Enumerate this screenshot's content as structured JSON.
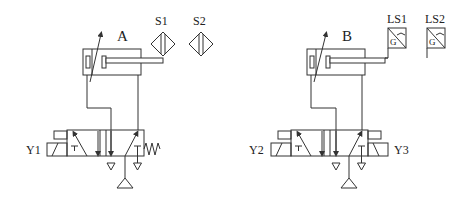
{
  "diagram": {
    "type": "pneumatic-circuit",
    "colors": {
      "stroke": "#333333",
      "background": "#ffffff"
    },
    "systems": [
      {
        "cylinder_label": "A",
        "sensors": [
          {
            "label": "S1",
            "type": "proximity-sensor"
          },
          {
            "label": "S2",
            "type": "proximity-sensor"
          }
        ],
        "valve": {
          "type": "4/2 solenoid valve, spring return",
          "solenoids": [
            "Y1"
          ]
        }
      },
      {
        "cylinder_label": "B",
        "sensors": [
          {
            "label": "LS1",
            "type": "limit-switch",
            "inner_label": "G"
          },
          {
            "label": "LS2",
            "type": "limit-switch",
            "inner_label": "G"
          }
        ],
        "valve": {
          "type": "4/2 double solenoid valve",
          "solenoids": [
            "Y2",
            "Y3"
          ]
        }
      }
    ]
  }
}
